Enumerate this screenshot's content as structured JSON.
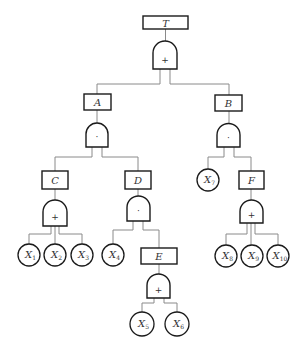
{
  "diagram": {
    "type": "fault-tree",
    "colors": {
      "stroke": "#1a1a1a",
      "edge": "#8a8a8a",
      "text": "#333333",
      "background": "#ffffff"
    },
    "events": {
      "T": {
        "label": "T"
      },
      "A": {
        "label": "A"
      },
      "B": {
        "label": "B"
      },
      "C": {
        "label": "C"
      },
      "D": {
        "label": "D"
      },
      "E": {
        "label": "E"
      },
      "F": {
        "label": "F"
      }
    },
    "gates": {
      "T": {
        "symbol": "+",
        "kind": "OR"
      },
      "A": {
        "symbol": "·",
        "kind": "AND"
      },
      "B": {
        "symbol": "·",
        "kind": "AND"
      },
      "C": {
        "symbol": "+",
        "kind": "OR"
      },
      "D": {
        "symbol": "·",
        "kind": "AND"
      },
      "E": {
        "symbol": "+",
        "kind": "OR"
      },
      "F": {
        "symbol": "+",
        "kind": "OR"
      }
    },
    "basic_events": {
      "X1": {
        "base": "X",
        "sub": "1"
      },
      "X2": {
        "base": "X",
        "sub": "2"
      },
      "X3": {
        "base": "X",
        "sub": "3"
      },
      "X4": {
        "base": "X",
        "sub": "4"
      },
      "X5": {
        "base": "X",
        "sub": "5"
      },
      "X6": {
        "base": "X",
        "sub": "6"
      },
      "X7": {
        "base": "X",
        "sub": "7"
      },
      "X8": {
        "base": "X",
        "sub": "8"
      },
      "X9": {
        "base": "X",
        "sub": "9"
      },
      "X10": {
        "base": "X",
        "sub": "10"
      }
    },
    "structure": {
      "T": [
        "A",
        "B"
      ],
      "A": [
        "C",
        "D"
      ],
      "B": [
        "X7",
        "F"
      ],
      "C": [
        "X1",
        "X2",
        "X3"
      ],
      "D": [
        "X4",
        "E"
      ],
      "E": [
        "X5",
        "X6"
      ],
      "F": [
        "X8",
        "X9",
        "X10"
      ]
    }
  }
}
